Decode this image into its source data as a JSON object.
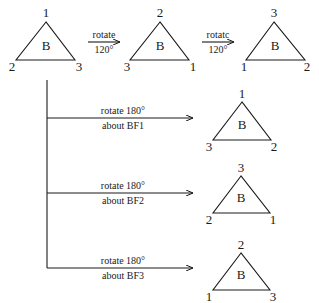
{
  "diagram": {
    "top_row": {
      "triangles": [
        {
          "center": "B",
          "top": "1",
          "left": "2",
          "right": "3"
        },
        {
          "center": "B",
          "top": "2",
          "left": "3",
          "right": "1"
        },
        {
          "center": "B",
          "top": "3",
          "left": "1",
          "right": "2"
        }
      ],
      "arrows": [
        {
          "label_top": "rotate",
          "label_bottom": "120°"
        },
        {
          "label_top": "rotatc",
          "label_bottom": "120°"
        }
      ]
    },
    "branches": [
      {
        "label_top": "rotate 180°",
        "label_bottom": "about BF1",
        "triangle": {
          "center": "B",
          "top": "1",
          "left": "3",
          "right": "2"
        }
      },
      {
        "label_top": "rotate 180°",
        "label_bottom": "about BF2",
        "triangle": {
          "center": "B",
          "top": "3",
          "left": "2",
          "right": "1"
        }
      },
      {
        "label_top": "rotate 180°",
        "label_bottom": "about BF3",
        "triangle": {
          "center": "B",
          "top": "2",
          "left": "1",
          "right": "3"
        }
      }
    ]
  }
}
